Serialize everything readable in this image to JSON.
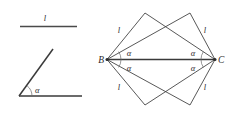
{
  "figure": {
    "background_color": "#ffffff",
    "line_color": "#3a3a3a",
    "given_line_color": "#4a4a4a",
    "arc_color": "#6a6a6a",
    "label_color": "#2b2b2b"
  },
  "given": {
    "segment_label": "l",
    "angle_label": "α"
  },
  "construction": {
    "point_b": "B",
    "point_c": "C",
    "side_labels": [
      "l",
      "l",
      "l",
      "l"
    ],
    "angle_labels": [
      "α",
      "α",
      "α",
      "α"
    ]
  }
}
